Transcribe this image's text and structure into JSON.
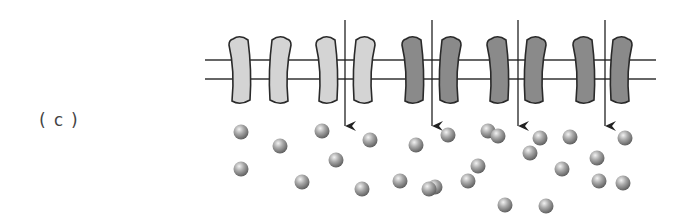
{
  "figure": {
    "panel_label": "(c)",
    "colors": {
      "light_protein": "#d4d4d4",
      "dark_protein": "#8a8a8a",
      "outline": "#2a2a2a",
      "membrane_line": "#333333",
      "arrow": "#222222",
      "particle": "#9a9a9a"
    },
    "proteins": [
      {
        "cx": 240,
        "shade": "light",
        "bend": "left"
      },
      {
        "cx": 280,
        "shade": "light",
        "bend": "right"
      },
      {
        "cx": 327,
        "shade": "light",
        "bend": "left"
      },
      {
        "cx": 364,
        "shade": "light",
        "bend": "right"
      },
      {
        "cx": 413,
        "shade": "dark",
        "bend": "left"
      },
      {
        "cx": 450,
        "shade": "dark",
        "bend": "right"
      },
      {
        "cx": 498,
        "shade": "dark",
        "bend": "left"
      },
      {
        "cx": 535,
        "shade": "dark",
        "bend": "right"
      },
      {
        "cx": 584,
        "shade": "dark",
        "bend": "left"
      },
      {
        "cx": 621,
        "shade": "dark",
        "bend": "right"
      }
    ],
    "arrows": [
      {
        "x": 345,
        "y1": 20,
        "y2": 126
      },
      {
        "x": 432,
        "y1": 20,
        "y2": 126
      },
      {
        "x": 518,
        "y1": 20,
        "y2": 126
      },
      {
        "x": 605,
        "y1": 20,
        "y2": 126
      }
    ],
    "particles": [
      [
        241,
        132
      ],
      [
        280,
        146
      ],
      [
        322,
        131
      ],
      [
        336,
        160
      ],
      [
        241,
        169
      ],
      [
        302,
        182
      ],
      [
        370,
        140
      ],
      [
        416,
        145
      ],
      [
        448,
        135
      ],
      [
        488,
        131
      ],
      [
        435,
        187
      ],
      [
        562,
        169
      ],
      [
        362,
        189
      ],
      [
        400,
        181
      ],
      [
        429,
        189
      ],
      [
        468,
        181
      ],
      [
        498,
        136
      ],
      [
        599,
        181
      ],
      [
        530,
        153
      ],
      [
        540,
        138
      ],
      [
        570,
        137
      ],
      [
        597,
        158
      ],
      [
        625,
        138
      ],
      [
        623,
        183
      ],
      [
        505,
        205
      ],
      [
        546,
        206
      ],
      [
        478,
        166
      ]
    ]
  }
}
